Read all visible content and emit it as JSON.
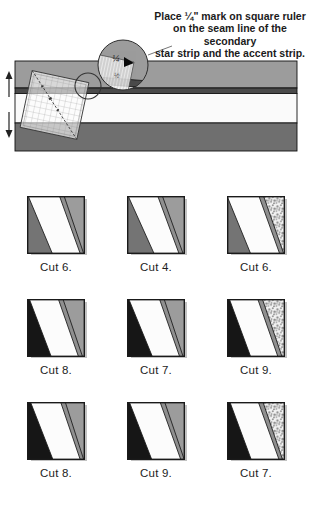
{
  "caption": {
    "lines": [
      "Place ¼\" mark on square ruler",
      "on the seam line of the secondary",
      "star strip and the accent strip."
    ]
  },
  "figure": {
    "magnifier": {
      "quarter_label": "¼",
      "half_label": "½"
    },
    "colors": {
      "secondary_star_strip": "#9c9c9c",
      "accent_strip": "#4a4a4a",
      "background_strip": "#fafafa",
      "main_star_strip": "#6f6f6f"
    }
  },
  "tiles": {
    "colors": {
      "gray_triangle": "#747474",
      "black_triangle": "#161616",
      "white_band": "#fcfcfc",
      "accent_band": "#8f8f8f",
      "gray_corner": "#9c9c9c",
      "speckle_dot": "#909090",
      "speckle_bg": "#f3f3f3"
    },
    "items": [
      {
        "label": "Cut 6.",
        "triangle": "gray",
        "corner": "gray",
        "s1": [
          2,
          44
        ],
        "s2": [
          56,
          92
        ],
        "s3": [
          64,
          98
        ]
      },
      {
        "label": "Cut 4.",
        "triangle": "gray",
        "corner": "gray",
        "s1": [
          2,
          47
        ],
        "s2": [
          53,
          90
        ],
        "s3": [
          61,
          97
        ]
      },
      {
        "label": "Cut 6.",
        "triangle": "gray",
        "corner": "speckle",
        "s1": [
          0,
          41
        ],
        "s2": [
          55,
          91
        ],
        "s3": [
          63,
          98
        ]
      },
      {
        "label": "Cut 8.",
        "triangle": "black",
        "corner": "gray",
        "s1": [
          4,
          42
        ],
        "s2": [
          54,
          89
        ],
        "s3": [
          62,
          96
        ]
      },
      {
        "label": "Cut 7.",
        "triangle": "black",
        "corner": "gray",
        "s1": [
          3,
          44
        ],
        "s2": [
          56,
          91
        ],
        "s3": [
          64,
          97
        ]
      },
      {
        "label": "Cut 9.",
        "triangle": "black",
        "corner": "speckle",
        "s1": [
          4,
          41
        ],
        "s2": [
          53,
          88
        ],
        "s3": [
          61,
          95
        ]
      },
      {
        "label": "Cut 8.",
        "triangle": "black",
        "corner": "gray",
        "s1": [
          6,
          45
        ],
        "s2": [
          58,
          92
        ],
        "s3": [
          66,
          98
        ]
      },
      {
        "label": "Cut 9.",
        "triangle": "black",
        "corner": "gray",
        "s1": [
          4,
          43
        ],
        "s2": [
          57,
          93
        ],
        "s3": [
          65,
          99
        ]
      },
      {
        "label": "Cut 7.",
        "triangle": "black",
        "corner": "speckle",
        "s1": [
          5,
          42
        ],
        "s2": [
          54,
          90
        ],
        "s3": [
          62,
          96
        ]
      }
    ]
  }
}
